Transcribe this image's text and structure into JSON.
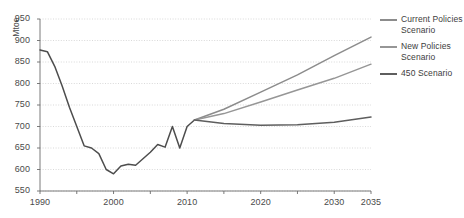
{
  "figure": {
    "clipped_title": "",
    "width": 464,
    "height": 218
  },
  "axes": {
    "y_unit_label": "Mtoe",
    "y_ticks": [
      550,
      600,
      650,
      700,
      750,
      800,
      850,
      900,
      950
    ],
    "x_ticks_labeled": [
      1990,
      2000,
      2010,
      2020,
      2030,
      2035
    ],
    "x_ticks_minor": [
      1995,
      2005,
      2015,
      2025
    ]
  },
  "legend": {
    "items": [
      {
        "label": "Current Policies Scenario",
        "color": "#8c8c8c"
      },
      {
        "label": "New Policies Scenario",
        "color": "#969696"
      },
      {
        "label": "450 Scenario",
        "color": "#5e5e5e"
      }
    ]
  },
  "colors": {
    "historical": "#4d4d4d",
    "current_policies": "#8c8c8c",
    "new_policies": "#969696",
    "scenario_450": "#5e5e5e",
    "gridline": "#cfcfcf",
    "axis": "#6b6b6b",
    "text": "#4a4a4a"
  },
  "chart_data": {
    "type": "line",
    "title": "",
    "xlabel": "",
    "ylabel": "Mtoe",
    "xlim": [
      1990,
      2035
    ],
    "ylim": [
      550,
      950
    ],
    "grid": true,
    "legend_position": "right",
    "x": [
      1990,
      1991,
      1992,
      1993,
      1994,
      1995,
      1996,
      1997,
      1998,
      1999,
      2000,
      2001,
      2002,
      2003,
      2004,
      2005,
      2006,
      2007,
      2008,
      2009,
      2010,
      2011
    ],
    "series": [
      {
        "name": "Historical",
        "color": "#4d4d4d",
        "x": [
          1990,
          1991,
          1992,
          1993,
          1994,
          1995,
          1996,
          1997,
          1998,
          1999,
          2000,
          2001,
          2002,
          2003,
          2004,
          2005,
          2006,
          2007,
          2008,
          2009,
          2010,
          2011
        ],
        "values": [
          878,
          874,
          840,
          795,
          745,
          700,
          655,
          650,
          637,
          600,
          590,
          608,
          612,
          610,
          625,
          640,
          658,
          652,
          700,
          650,
          700,
          715
        ]
      },
      {
        "name": "Current Policies Scenario",
        "color": "#8c8c8c",
        "x": [
          2011,
          2015,
          2020,
          2025,
          2030,
          2035
        ],
        "values": [
          715,
          740,
          780,
          820,
          865,
          908
        ]
      },
      {
        "name": "New Policies Scenario",
        "color": "#969696",
        "x": [
          2011,
          2015,
          2020,
          2025,
          2030,
          2035
        ],
        "values": [
          715,
          730,
          757,
          785,
          812,
          845
        ]
      },
      {
        "name": "450 Scenario",
        "color": "#5e5e5e",
        "x": [
          2011,
          2015,
          2020,
          2025,
          2030,
          2035
        ],
        "values": [
          715,
          707,
          703,
          704,
          710,
          722
        ]
      }
    ]
  }
}
